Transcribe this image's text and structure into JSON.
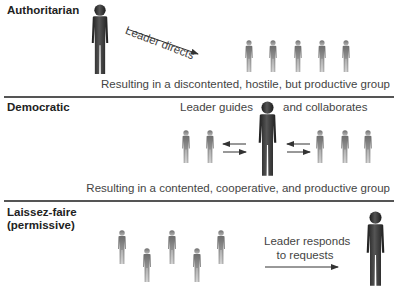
{
  "sections": [
    {
      "title": "Authoritarian",
      "leader_action": "Leader directs",
      "result": "Resulting in a discontented, hostile, but productive group",
      "group_size": 5
    },
    {
      "title": "Democratic",
      "leader_action_left": "Leader guides",
      "leader_action_right": "and collaborates",
      "result": "Resulting in a contented, cooperative, and productive group",
      "group_size": 5
    },
    {
      "title_line1": "Laissez-faire",
      "title_line2": "(permissive)",
      "leader_action_line1": "Leader responds",
      "leader_action_line2": "to requests",
      "group_size": 5
    }
  ],
  "colors": {
    "leader": "#2a2a2a",
    "member": "#8a8a8a",
    "divider": "#555555",
    "text": "#444444"
  }
}
